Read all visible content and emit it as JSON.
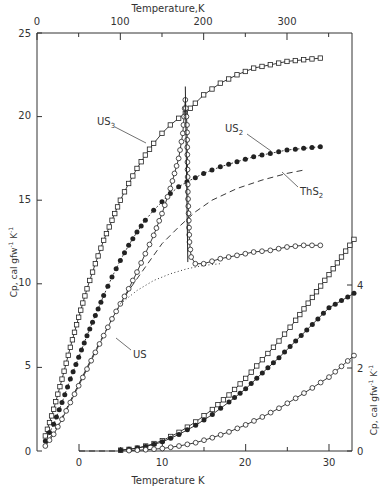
{
  "chart_data": {
    "type": "line",
    "title": "",
    "top_axis": {
      "label": "Temperature,K",
      "ticks": [
        0,
        100,
        200,
        300
      ],
      "range": [
        0,
        380
      ]
    },
    "left_axis": {
      "label": "Cp, cal gfw⁻¹ K⁻¹",
      "ticks": [
        0,
        5,
        10,
        15,
        20,
        25
      ],
      "range": [
        0,
        25
      ]
    },
    "bottom_axis": {
      "label": "Temperature  K",
      "ticks": [
        0,
        10,
        20,
        30
      ],
      "range": [
        0,
        33
      ]
    },
    "right_axis": {
      "label": "Cp, cal gfw⁻¹ K⁻¹",
      "ticks": [
        0,
        2,
        4
      ],
      "range": [
        0,
        5
      ]
    },
    "grid": false,
    "legend": "inline labels",
    "series_high_T": [
      {
        "name": "US3",
        "marker": "open-square",
        "line": "solid",
        "x": [
          10,
          20,
          30,
          40,
          50,
          60,
          70,
          80,
          90,
          100,
          110,
          120,
          130,
          140,
          150,
          160,
          170,
          178,
          190,
          200,
          220,
          240,
          260,
          280,
          300,
          320,
          340
        ],
        "y": [
          0.9,
          2.5,
          4.3,
          6.2,
          8.0,
          9.7,
          11.2,
          12.6,
          13.8,
          15.0,
          16.0,
          16.9,
          17.7,
          18.4,
          19.0,
          19.5,
          19.9,
          20.2,
          20.8,
          21.3,
          22.0,
          22.5,
          22.9,
          23.1,
          23.3,
          23.4,
          23.5
        ]
      },
      {
        "name": "US2",
        "marker": "filled-circle",
        "line": "dotted-with-markers",
        "x": [
          10,
          20,
          30,
          40,
          50,
          60,
          70,
          80,
          90,
          100,
          110,
          120,
          130,
          140,
          150,
          160,
          170,
          180,
          200,
          220,
          240,
          260,
          280,
          300,
          320,
          340
        ],
        "y": [
          0.6,
          1.6,
          2.9,
          4.3,
          5.6,
          6.9,
          8.1,
          9.3,
          10.4,
          11.4,
          12.3,
          13.1,
          13.8,
          14.4,
          14.9,
          15.4,
          15.8,
          16.1,
          16.6,
          17.0,
          17.3,
          17.6,
          17.8,
          18.0,
          18.1,
          18.2
        ]
      },
      {
        "name": "ThS2",
        "marker": "none",
        "line": "dashed",
        "x": [
          10,
          30,
          50,
          70,
          90,
          110,
          130,
          150,
          170,
          190,
          210,
          240,
          270,
          300,
          320
        ],
        "y": [
          0.3,
          2.0,
          4.0,
          6.0,
          7.9,
          9.6,
          11.0,
          12.4,
          13.4,
          14.3,
          15.0,
          15.7,
          16.2,
          16.6,
          16.8
        ]
      },
      {
        "name": "US",
        "marker": "open-circle",
        "line": "solid",
        "x": [
          10,
          20,
          30,
          40,
          50,
          60,
          70,
          80,
          90,
          100,
          110,
          120,
          130,
          140,
          150,
          160,
          170,
          175,
          178,
          180,
          181,
          183,
          185,
          190,
          200,
          220,
          240,
          260,
          280,
          300,
          320,
          340
        ],
        "y": [
          0.3,
          1.0,
          1.9,
          2.9,
          3.9,
          4.9,
          5.9,
          6.9,
          7.9,
          8.8,
          9.7,
          10.7,
          11.8,
          12.9,
          14.2,
          15.7,
          17.5,
          19.0,
          21.0,
          19.5,
          15.5,
          12.5,
          11.6,
          11.2,
          11.2,
          11.5,
          11.7,
          11.9,
          12.0,
          12.2,
          12.3,
          12.3
        ]
      },
      {
        "name": "US (lattice estimate)",
        "marker": "none",
        "line": "dotted",
        "x": [
          100,
          120,
          140,
          160,
          180,
          200,
          220
        ],
        "y": [
          8.8,
          9.6,
          10.2,
          10.6,
          10.9,
          11.1,
          11.2
        ]
      }
    ],
    "series_low_T": [
      {
        "name": "US3",
        "marker": "open-square",
        "x": [
          5,
          6,
          7,
          8,
          9,
          10,
          12,
          14,
          16,
          18,
          20,
          22,
          24,
          26,
          28,
          30,
          33
        ],
        "y": [
          0.02,
          0.04,
          0.07,
          0.12,
          0.18,
          0.25,
          0.45,
          0.7,
          1.0,
          1.35,
          1.75,
          2.2,
          2.65,
          3.15,
          3.7,
          4.25,
          5.1
        ]
      },
      {
        "name": "US2",
        "marker": "filled-circle",
        "x": [
          5,
          6,
          7,
          8,
          9,
          10,
          12,
          14,
          16,
          18,
          20,
          22,
          24,
          26,
          28,
          30,
          33
        ],
        "y": [
          0.02,
          0.04,
          0.07,
          0.11,
          0.16,
          0.22,
          0.4,
          0.62,
          0.88,
          1.18,
          1.5,
          1.88,
          2.25,
          2.65,
          3.05,
          3.45,
          3.8
        ]
      },
      {
        "name": "US",
        "marker": "open-circle",
        "x": [
          6,
          8,
          10,
          12,
          14,
          16,
          18,
          20,
          22,
          24,
          26,
          28,
          30,
          33
        ],
        "y": [
          0.01,
          0.03,
          0.06,
          0.12,
          0.2,
          0.32,
          0.46,
          0.63,
          0.82,
          1.03,
          1.27,
          1.52,
          1.78,
          2.3
        ]
      },
      {
        "name": "baseline",
        "marker": "none",
        "line": "dashed",
        "x": [
          0,
          5
        ],
        "y": [
          0,
          0
        ]
      }
    ],
    "annotations": [
      {
        "text": "US3",
        "target": "US3"
      },
      {
        "text": "US2",
        "target": "US2"
      },
      {
        "text": "ThS2",
        "target": "ThS2"
      },
      {
        "text": "US",
        "target": "US"
      }
    ]
  },
  "labels": {
    "top_axis_title": "Temperature,K",
    "bottom_axis_title": "Temperature  K",
    "left_axis_title": "Cp, cal gfw",
    "right_axis_title": "Cp, cal gfw",
    "unit_suffix": "K",
    "us3": "US",
    "us2": "US",
    "ths2": "ThS",
    "us": "US",
    "sub3": "3",
    "sub2": "2",
    "sup_neg1": "-1"
  },
  "ticks": {
    "top": [
      "0",
      "100",
      "200",
      "300"
    ],
    "left": [
      "25",
      "20",
      "15",
      "10",
      "5",
      "0"
    ],
    "bottom": [
      "0",
      "10",
      "20",
      "30"
    ],
    "right": [
      "4",
      "2",
      "0"
    ]
  }
}
